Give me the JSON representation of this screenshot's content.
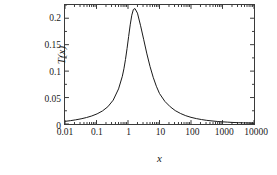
{
  "chart_data": {
    "type": "line",
    "title": "",
    "xlabel": "x",
    "ylabel": "T(x)",
    "xscale": "log",
    "yscale": "linear",
    "xlim": [
      0.01,
      10000
    ],
    "ylim": [
      0,
      0.225
    ],
    "grid": false,
    "legend": null,
    "xticks": [
      0.01,
      0.1,
      1,
      10,
      100,
      1000,
      10000
    ],
    "xticklabels": [
      "0.01",
      "0.1",
      "1",
      "10",
      "100",
      "1000",
      "10000"
    ],
    "yticks": [
      0,
      0.05,
      0.1,
      0.15,
      0.2
    ],
    "yticklabels": [
      "0",
      "0.05",
      "0.1",
      "0.15",
      "0.2"
    ],
    "line_color": "#1a1a1a",
    "frame_color": "#3a3a3a",
    "background": "#ffffff",
    "series": [
      {
        "name": "T(x)",
        "x": [
          0.01,
          0.0148,
          0.0219,
          0.0324,
          0.0479,
          0.0708,
          0.1047,
          0.1549,
          0.2291,
          0.3388,
          0.5012,
          0.6607,
          0.7413,
          0.8318,
          0.9333,
          1.0471,
          1.175,
          1.3183,
          1.4791,
          1.6596,
          1.9953,
          2.5119,
          3.1623,
          3.981,
          5.0119,
          6.3096,
          7.9433,
          10.0,
          14.79,
          21.88,
          31.62,
          46.77,
          68.13,
          100.0,
          147.9,
          215.4,
          316.2,
          464.2,
          681.3,
          1000.0,
          1468.0,
          2154.0,
          3162.0,
          4642.0,
          6813.0,
          10000.0
        ],
        "y": [
          0.005,
          0.0063,
          0.0079,
          0.0098,
          0.0122,
          0.0152,
          0.0192,
          0.0247,
          0.0326,
          0.0451,
          0.0664,
          0.0902,
          0.1044,
          0.1219,
          0.1427,
          0.1654,
          0.1875,
          0.2057,
          0.2164,
          0.2183,
          0.2096,
          0.1857,
          0.1593,
          0.1325,
          0.1086,
          0.0883,
          0.0714,
          0.0576,
          0.0428,
          0.0326,
          0.0253,
          0.0198,
          0.0157,
          0.0126,
          0.0102,
          0.0084,
          0.0069,
          0.0058,
          0.0048,
          0.0041,
          0.0035,
          0.0029,
          0.0025,
          0.0022,
          0.0019,
          0.0016
        ]
      }
    ]
  }
}
